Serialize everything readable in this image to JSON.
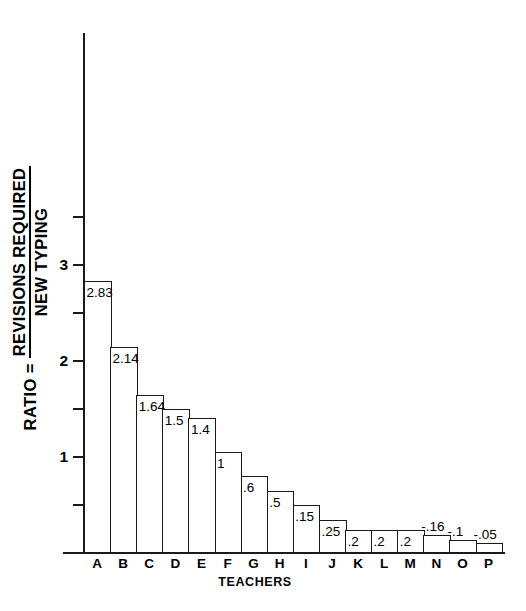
{
  "chart_data": {
    "type": "bar",
    "title": "",
    "subtitle": "",
    "xlabel": "TEACHERS",
    "ylabel": "RATIO = REVISIONS REQUIRED / NEW TYPING",
    "ylabel_parts": {
      "prefix": "RATIO =",
      "numerator": "REVISIONS REQUIRED",
      "denominator": "NEW TYPING"
    },
    "categories": [
      "A",
      "B",
      "C",
      "D",
      "E",
      "F",
      "G",
      "H",
      "I",
      "J",
      "K",
      "L",
      "M",
      "N",
      "O",
      "P"
    ],
    "values": [
      2.83,
      2.14,
      1.64,
      1.5,
      1.4,
      1,
      0.6,
      0.5,
      0.15,
      0.25,
      0.2,
      0.2,
      0.2,
      -0.16,
      -0.1,
      -0.05
    ],
    "value_labels": [
      "2.83",
      "2.14",
      "1.64",
      "1.5",
      "1.4",
      "1",
      ".6",
      ".5",
      ".15",
      ".25",
      ".2",
      ".2",
      ".2",
      "-.16",
      "-.1",
      "-.05"
    ],
    "label_placement": [
      "inside",
      "inside",
      "inside",
      "inside",
      "inside",
      "inside",
      "inside",
      "inside",
      "inside",
      "inside",
      "inside",
      "inside",
      "inside",
      "above",
      "above",
      "above"
    ],
    "ylim": [
      0,
      3.5
    ],
    "yticks_labeled": [
      1,
      2,
      3
    ],
    "ytick_labels": [
      "1",
      "2",
      "3"
    ],
    "yticks_minor": [
      0.5,
      1.5,
      2.5,
      3.5
    ],
    "grid": false,
    "legend": null,
    "bar_style": "outline",
    "bar_gap": 0
  },
  "axes": {
    "y_label_text": "RATIO = REVISIONS REQUIRED NEW TYPING",
    "x_label_text": "TEACHERS"
  },
  "colors": {
    "background": "#ffffff",
    "ink": "#1a1a1a",
    "bar_fill": "#ffffff",
    "bar_stroke": "#1a1a1a"
  }
}
